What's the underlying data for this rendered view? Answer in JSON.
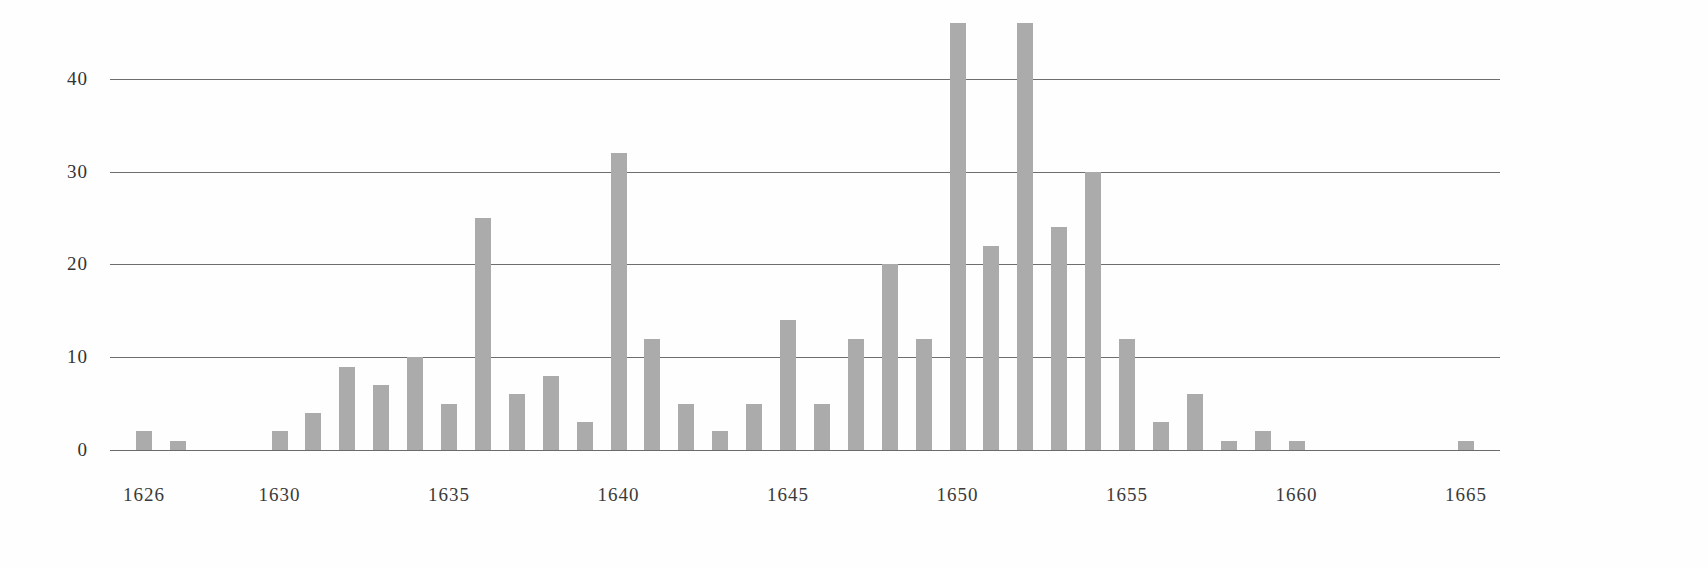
{
  "chart_data": {
    "type": "bar",
    "title": "",
    "subtitle": "",
    "xlabel": "",
    "ylabel": "",
    "ylim": [
      0,
      47
    ],
    "yticks": [
      0,
      10,
      20,
      30,
      40
    ],
    "ytick_labels": [
      "0",
      "10",
      "20",
      "30",
      "40"
    ],
    "xtick_labels": [
      "1626",
      "1630",
      "1635",
      "1640",
      "1645",
      "1650",
      "1655",
      "1660",
      "1665"
    ],
    "xticks": [
      1626,
      1630,
      1635,
      1640,
      1645,
      1650,
      1655,
      1660,
      1665
    ],
    "xlim": [
      1625,
      1666
    ],
    "grid": true,
    "legend": null,
    "bar_color": "#ababab",
    "axis_color": "#6e6e6e",
    "text_color": "#333333",
    "categories": [
      1626,
      1627,
      1628,
      1629,
      1630,
      1631,
      1632,
      1633,
      1634,
      1635,
      1636,
      1637,
      1638,
      1639,
      1640,
      1641,
      1642,
      1643,
      1644,
      1645,
      1646,
      1647,
      1648,
      1649,
      1650,
      1651,
      1652,
      1653,
      1654,
      1655,
      1656,
      1657,
      1658,
      1659,
      1660,
      1661,
      1662,
      1663,
      1664,
      1665
    ],
    "values": [
      2,
      1,
      0,
      0,
      2,
      4,
      9,
      7,
      10,
      5,
      25,
      6,
      8,
      3,
      32,
      12,
      5,
      2,
      5,
      14,
      5,
      12,
      20,
      12,
      46,
      22,
      46,
      24,
      30,
      12,
      3,
      6,
      1,
      2,
      1,
      0,
      0,
      0,
      0,
      1
    ]
  }
}
